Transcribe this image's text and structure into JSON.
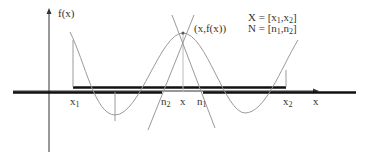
{
  "diagram": {
    "y_axis_label": "f(x)",
    "x_axis_label": "x",
    "point_label": "(x,f(x))",
    "legend": {
      "line1": {
        "lhs": "X = [",
        "a": "x",
        "a_sub": "1",
        "sep": ",",
        "b": "x",
        "b_sub": "2",
        "end": "]"
      },
      "line2": {
        "lhs": "N = [",
        "a": "n",
        "a_sub": "1",
        "sep": ",",
        "b": "n",
        "b_sub": "2",
        "end": "]"
      }
    },
    "tick_labels": {
      "x1": {
        "base": "x",
        "sub": "1"
      },
      "n2": {
        "base": "n",
        "sub": "2"
      },
      "x": {
        "base": "x",
        "sub": ""
      },
      "n1": {
        "base": "n",
        "sub": "1"
      },
      "x2": {
        "base": "x",
        "sub": "2"
      }
    },
    "colors": {
      "axis": "#333333",
      "curve": "#9a9a9a",
      "interval_bar": "#111111",
      "text": "#333333"
    }
  }
}
